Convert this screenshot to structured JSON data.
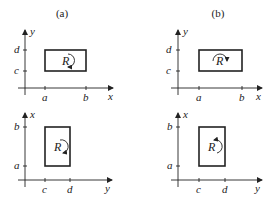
{
  "columns": [
    {
      "title": "(a)"
    },
    {
      "title": "(b)"
    }
  ],
  "panels": [
    {
      "id": "top-left",
      "vertical_axis": "y",
      "horizontal_axis": "x",
      "vertical_ticks": [
        "d",
        "c"
      ],
      "horizontal_ticks": [
        "a",
        "b"
      ],
      "region": "R",
      "orientation": "clockwise"
    },
    {
      "id": "top-right",
      "vertical_axis": "y",
      "horizontal_axis": "x",
      "vertical_ticks": [
        "d",
        "c"
      ],
      "horizontal_ticks": [
        "a",
        "b"
      ],
      "region": "R",
      "orientation": "counterclockwise"
    },
    {
      "id": "bottom-left",
      "vertical_axis": "x",
      "horizontal_axis": "y",
      "vertical_ticks": [
        "b",
        "a"
      ],
      "horizontal_ticks": [
        "c",
        "d"
      ],
      "region": "R",
      "orientation": "clockwise"
    },
    {
      "id": "bottom-right",
      "vertical_axis": "x",
      "horizontal_axis": "y",
      "vertical_ticks": [
        "b",
        "a"
      ],
      "horizontal_ticks": [
        "c",
        "d"
      ],
      "region": "R",
      "orientation": "counterclockwise"
    }
  ]
}
